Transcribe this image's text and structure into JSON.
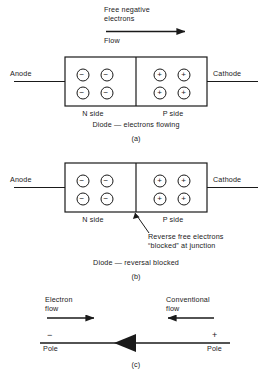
{
  "figure": {
    "title_alt": "Diode conduction and blocking diagram",
    "ink_color": "#1a1a1a",
    "background": "#ffffff"
  },
  "panel_a": {
    "flow_label_line1": "Free negative",
    "flow_label_line2": "electrons",
    "flow_label_line3": "Flow",
    "anode_label": "Anode",
    "cathode_label": "Cathode",
    "n_side_label": "N side",
    "p_side_label": "P side",
    "n_carriers": [
      "−",
      "−",
      "−",
      "−"
    ],
    "p_carriers": [
      "+",
      "+",
      "+",
      "+"
    ],
    "caption": "Diode — electrons flowing",
    "panel_letter": "(a)"
  },
  "panel_b": {
    "anode_label": "Anode",
    "cathode_label": "Cathode",
    "n_side_label": "N side",
    "p_side_label": "P side",
    "n_carriers": [
      "−",
      "−",
      "−",
      "−"
    ],
    "p_carriers": [
      "+",
      "+",
      "+",
      "+"
    ],
    "annotation_line1": "Reverse free electrons",
    "annotation_line2": "“blocked” at junction",
    "caption": "Diode — reversal blocked",
    "panel_letter": "(b)"
  },
  "panel_c": {
    "electron_flow_line1": "Electron",
    "electron_flow_line2": "flow",
    "conventional_flow_line1": "Conventional",
    "conventional_flow_line2": "flow",
    "negative_sign": "−",
    "positive_sign": "+",
    "negative_pole_label": "Pole",
    "positive_pole_label": "Pole",
    "panel_letter": "(c)"
  }
}
